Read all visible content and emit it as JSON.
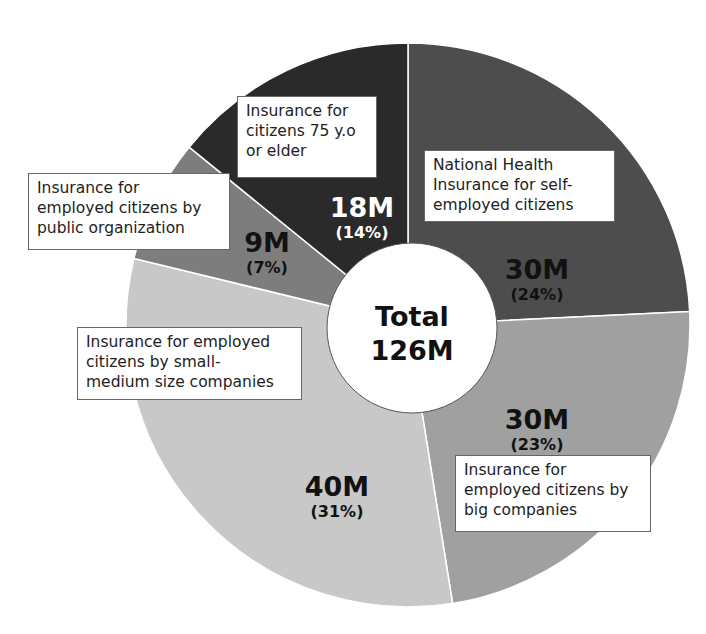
{
  "chart_data": {
    "type": "pie",
    "variant": "donut",
    "title": "",
    "center_label": {
      "line1": "Total",
      "line2": "126M"
    },
    "total": "126M",
    "start_angle_deg": 0,
    "direction": "clockwise",
    "categories": [
      "National Health Insurance for self-employed citizens",
      "Insurance for employed citizens by big companies",
      "Insurance for employed citizens by small-medium size companies",
      "Insurance for employed citizens by public organization",
      "Insurance for citizens 75 y.o or elder"
    ],
    "values_millions": [
      30,
      30,
      40,
      9,
      18
    ],
    "percentages": [
      24,
      23,
      31,
      7,
      14
    ],
    "value_labels": [
      "30M",
      "30M",
      "40M",
      "9M",
      "18M"
    ],
    "pct_labels": [
      "(24%)",
      "(23%)",
      "(31%)",
      "(7%)",
      "(14%)"
    ],
    "colors": [
      "#4d4d4d",
      "#a0a0a0",
      "#c8c8c8",
      "#7d7d7d",
      "#2a2a2a"
    ],
    "legend": "none (callout boxes)"
  },
  "labels": {
    "self_employed": [
      "National Health",
      "Insurance for self-",
      "employed citizens"
    ],
    "big_companies": [
      "Insurance for",
      "employed citizens by",
      "big companies"
    ],
    "small_medium": [
      "Insurance for employed",
      "citizens by small-",
      "medium size companies"
    ],
    "public_org": [
      "Insurance for",
      "employed citizens by",
      "public organization"
    ],
    "elder": [
      "Insurance for",
      "citizens 75 y.o",
      "or elder"
    ]
  }
}
